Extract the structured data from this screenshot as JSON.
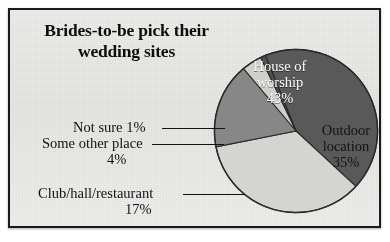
{
  "chart_data": {
    "type": "pie",
    "title": "Brides-to-be pick their wedding sites",
    "title_line1": "Brides-to-be pick their",
    "title_line2": "wedding sites",
    "categories": [
      "House of worship",
      "Outdoor location",
      "Club/hall/restaurant",
      "Some other place",
      "Not sure"
    ],
    "values": [
      43,
      35,
      17,
      4,
      1
    ],
    "unit": "%",
    "legend": "none",
    "grid": false,
    "xlabel": "",
    "ylabel": "",
    "slices": [
      {
        "label": "House of worship",
        "label_line1": "House of",
        "label_line2": "worship",
        "value": 43,
        "value_text": "43%",
        "color": "#595959",
        "text_color": "#ffffff",
        "placement": "inside"
      },
      {
        "label": "Outdoor location",
        "label_line1": "Outdoor",
        "label_line2": "location",
        "value": 35,
        "value_text": "35%",
        "color": "#d4d4d0",
        "text_color": "#131313",
        "placement": "inside"
      },
      {
        "label": "Club/hall/restaurant",
        "value": 17,
        "value_text": "17%",
        "color": "#878787",
        "text_color": "#111111",
        "placement": "callout"
      },
      {
        "label": "Some other place",
        "value": 4,
        "value_text": "4%",
        "color": "#cfcfcb",
        "text_color": "#111111",
        "placement": "callout"
      },
      {
        "label": "Not sure",
        "value": 1,
        "value_text": "1%",
        "color": "#4f4f4f",
        "text_color": "#111111",
        "placement": "callout"
      }
    ]
  },
  "title": {
    "line1": "Brides-to-be pick their",
    "line2": "wedding sites"
  },
  "pie_labels": {
    "worship_name_1": "House of",
    "worship_name_2": "worship",
    "worship_pct": "43%",
    "outdoor_name_1": "Outdoor",
    "outdoor_name_2": "location",
    "outdoor_pct": "35%"
  },
  "callouts": {
    "not_sure": "Not sure 1%",
    "some_other_place": "Some other place",
    "some_other_place_pct": "4%",
    "club_hall_restaurant": "Club/hall/restaurant",
    "club_hall_restaurant_pct": "17%"
  },
  "colors": {
    "slice_dark": "#595959",
    "slice_light": "#d4d4d0",
    "slice_medium": "#878787",
    "slice_pale": "#cfcfcb",
    "slice_darkest": "#4f4f4f",
    "background": "#e9e9e6",
    "frame": "#1b1b1b",
    "text": "#111111",
    "label_on_dark": "#ffffff"
  }
}
